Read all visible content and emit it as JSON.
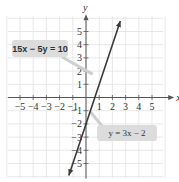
{
  "chart_data": {
    "type": "line",
    "title": "",
    "xlabel": "x",
    "ylabel": "y",
    "xlim": [
      -6,
      6
    ],
    "ylim": [
      -6,
      6
    ],
    "grid": true,
    "x_ticks": [
      -5,
      -4,
      -3,
      -2,
      -1,
      1,
      2,
      3,
      4,
      5
    ],
    "y_ticks": [
      5,
      4,
      3,
      2,
      1,
      -1,
      -2,
      -3,
      -4,
      -5
    ],
    "x_tick_labels": [
      "−5",
      "−4",
      "−3",
      "−2",
      "−1",
      "1",
      "2",
      "3",
      "4",
      "5"
    ],
    "y_tick_labels": [
      "5",
      "4",
      "3",
      "2",
      "1",
      "−1",
      "−2",
      "−3",
      "−4",
      "−5"
    ],
    "series": [
      {
        "name": "y = 3x − 2",
        "equation": "y = 3x - 2",
        "slope": 3,
        "intercept": -2,
        "x": [
          -1.3,
          2.6
        ],
        "y": [
          -5.9,
          5.8
        ],
        "color": "#3a3a3a"
      }
    ],
    "annotations": [
      {
        "text": "15x − 5y = 10",
        "points_to": [
          0.5,
          2
        ]
      },
      {
        "text": "y = 3x − 2",
        "points_to": [
          0.3,
          -1.1
        ]
      }
    ]
  },
  "labels": {
    "eq_standard": "15x − 5y = 10",
    "eq_slope_intercept": "y = 3x − 2",
    "x_axis": "x",
    "y_axis": "y"
  },
  "colors": {
    "grid": "#e2e2e2",
    "axis": "#555555",
    "line": "#3a3a3a",
    "label_bg": "#dcdcdc"
  }
}
